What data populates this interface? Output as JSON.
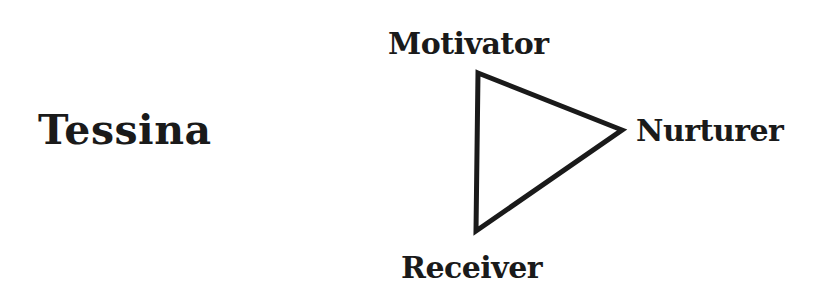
{
  "subject": {
    "name": "Tessina"
  },
  "triangle": {
    "stroke_color": "#1a1a1a",
    "vertices": {
      "top": {
        "label": "Motivator",
        "x": 478,
        "y": 73
      },
      "right": {
        "label": "Nurturer",
        "x": 622,
        "y": 130
      },
      "bottom": {
        "label": "Receiver",
        "x": 476,
        "y": 231
      }
    }
  }
}
